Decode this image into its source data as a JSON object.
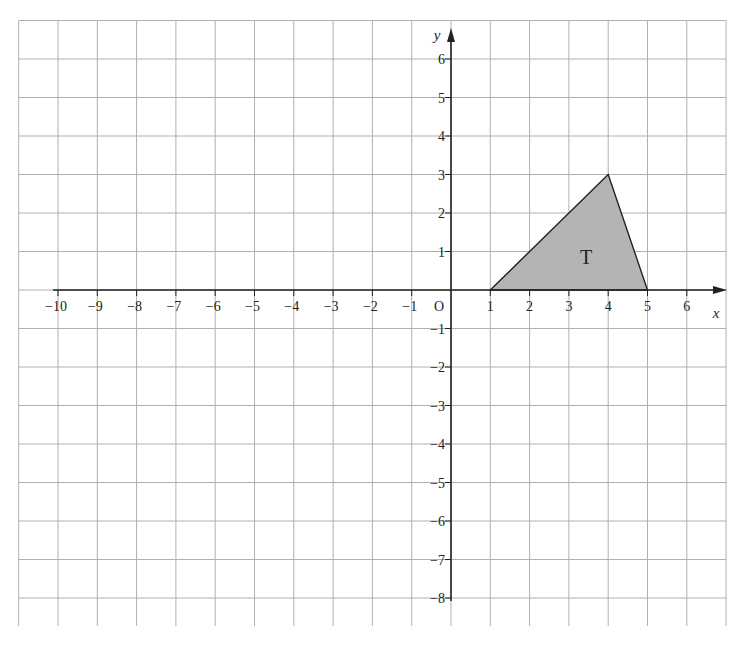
{
  "figure": {
    "type": "coordinate-grid",
    "origin_label": "O",
    "x_axis_label": "x",
    "y_axis_label": "y",
    "x_range": [
      -10,
      6
    ],
    "y_range": [
      -8,
      6
    ],
    "grid_x_extent": [
      -11,
      7
    ],
    "grid_y_extent": [
      -8,
      7
    ],
    "x_tick_labels": [
      "−10",
      "−9",
      "−8",
      "−7",
      "−6",
      "−5",
      "−4",
      "−3",
      "−2",
      "−1",
      "1",
      "2",
      "3",
      "4",
      "5",
      "6"
    ],
    "x_tick_values": [
      -10,
      -9,
      -8,
      -7,
      -6,
      -5,
      -4,
      -3,
      -2,
      -1,
      1,
      2,
      3,
      4,
      5,
      6
    ],
    "y_tick_labels": [
      "6",
      "5",
      "4",
      "3",
      "2",
      "1",
      "−1",
      "−2",
      "−3",
      "−4",
      "−5",
      "−6",
      "−7",
      "−8"
    ],
    "y_tick_values": [
      6,
      5,
      4,
      3,
      2,
      1,
      -1,
      -2,
      -3,
      -4,
      -5,
      -6,
      -7,
      -8
    ],
    "shapes": [
      {
        "name": "T",
        "label": "T",
        "vertices": [
          [
            1,
            0
          ],
          [
            4,
            3
          ],
          [
            5,
            0
          ]
        ],
        "fill": "#b4b4b4",
        "stroke": "#222222"
      }
    ]
  },
  "colors": {
    "grid": "#b0b0b0",
    "axis": "#222222",
    "background": "#ffffff",
    "text": "#222222"
  }
}
